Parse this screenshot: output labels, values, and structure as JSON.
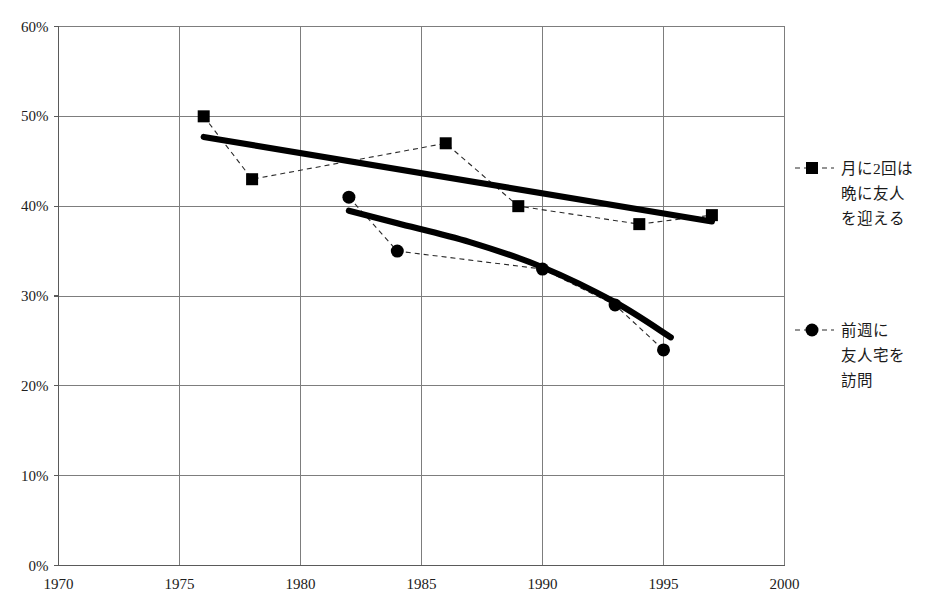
{
  "chart_data": {
    "type": "line",
    "title": "",
    "subtitle": "",
    "xlabel": "",
    "ylabel": "",
    "xlim": [
      1970,
      2000
    ],
    "ylim": [
      0,
      60
    ],
    "grid": true,
    "legend_position": "right",
    "x_ticks": [
      "1970",
      "1975",
      "1980",
      "1985",
      "1990",
      "1995",
      "2000"
    ],
    "x_tick_values": [
      1970,
      1975,
      1980,
      1985,
      1990,
      1995,
      2000
    ],
    "y_ticks": [
      "0%",
      "10%",
      "20%",
      "30%",
      "40%",
      "50%",
      "60%"
    ],
    "y_tick_values": [
      0,
      10,
      20,
      30,
      40,
      50,
      60
    ],
    "series": [
      {
        "name": "月に2回は晩に友人を迎える",
        "marker": "square",
        "linestyle": "dashed",
        "x": [
          1976,
          1978,
          1986,
          1989,
          1994,
          1997
        ],
        "values": [
          50,
          43,
          47,
          40,
          38,
          39
        ],
        "trend": {
          "x": [
            1976,
            1997
          ],
          "values": [
            47.7,
            38.3
          ]
        }
      },
      {
        "name": "前週に友人宅を訪問",
        "marker": "circle",
        "linestyle": "dashed",
        "x": [
          1982,
          1984,
          1990,
          1993,
          1995
        ],
        "values": [
          41,
          35,
          33,
          29,
          24
        ],
        "trend": {
          "x": [
            1982,
            1984,
            1987,
            1990,
            1993,
            1995.3
          ],
          "values": [
            39.5,
            38.1,
            36.0,
            33.2,
            29.3,
            25.4
          ]
        }
      }
    ]
  },
  "legend": {
    "items": [
      {
        "marker": "square",
        "lines": [
          "月に2回は",
          "晩に友人",
          "を迎える"
        ]
      },
      {
        "marker": "circle",
        "lines": [
          "前週に",
          "友人宅を",
          "訪問"
        ]
      }
    ]
  },
  "footnote": {
    "text": ""
  }
}
